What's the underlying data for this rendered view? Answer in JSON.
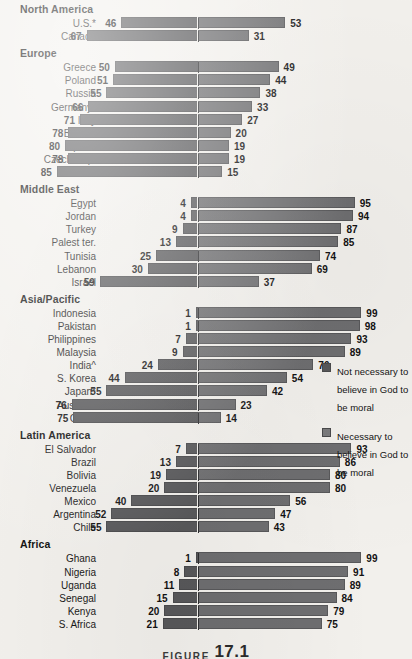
{
  "figure": {
    "word": "FIGURE",
    "number": "17.1"
  },
  "legend": {
    "items": [
      {
        "key": "not-necessary",
        "color": "#58585a",
        "label": "Not necessary to believe in God to be moral"
      },
      {
        "key": "necessary",
        "color": "#7b7b7d",
        "label": "Necessary to believe in God to be moral"
      }
    ]
  },
  "chart_data": {
    "type": "bar",
    "orientation": "horizontal",
    "subtype": "diverging-stacked",
    "title": "",
    "xlabel": "",
    "ylabel": "",
    "xlim": [
      -100,
      100
    ],
    "grid": false,
    "legend_position": "right",
    "series": [
      {
        "name": "Not necessary to believe in God to be moral",
        "side": "left",
        "color": "#58585a"
      },
      {
        "name": "Necessary to believe in God to be moral",
        "side": "right",
        "color": "#7b7b7d"
      }
    ],
    "groups": [
      {
        "name": "North America",
        "rows": [
          {
            "label": "U.S.*",
            "left": 46,
            "right": 53
          },
          {
            "label": "Canada",
            "left": 67,
            "right": 31
          }
        ]
      },
      {
        "name": "Europe",
        "rows": [
          {
            "label": "Greece",
            "left": 50,
            "right": 49
          },
          {
            "label": "Poland",
            "left": 51,
            "right": 44
          },
          {
            "label": "Russia",
            "left": 55,
            "right": 38
          },
          {
            "label": "Germany*",
            "left": 66,
            "right": 33
          },
          {
            "label": "Italy",
            "left": 71,
            "right": 27
          },
          {
            "label": "Britain*",
            "left": 78,
            "right": 20
          },
          {
            "label": "Spain*",
            "left": 80,
            "right": 19
          },
          {
            "label": "Czech Rep.",
            "left": 78,
            "right": 19
          },
          {
            "label": "France*",
            "left": 85,
            "right": 15
          }
        ]
      },
      {
        "name": "Middle East",
        "rows": [
          {
            "label": "Egypt",
            "left": 4,
            "right": 95
          },
          {
            "label": "Jordan",
            "left": 4,
            "right": 94
          },
          {
            "label": "Turkey",
            "left": 9,
            "right": 87
          },
          {
            "label": "Palest ter.",
            "left": 13,
            "right": 85
          },
          {
            "label": "Tunisia",
            "left": 25,
            "right": 74
          },
          {
            "label": "Lebanon",
            "left": 30,
            "right": 69
          },
          {
            "label": "Israel",
            "left": 59,
            "right": 37
          }
        ]
      },
      {
        "name": "Asia/Pacific",
        "rows": [
          {
            "label": "Indonesia",
            "left": 1,
            "right": 99
          },
          {
            "label": "Pakistan",
            "left": 1,
            "right": 98
          },
          {
            "label": "Philippines",
            "left": 7,
            "right": 93
          },
          {
            "label": "Malaysia",
            "left": 9,
            "right": 89
          },
          {
            "label": "India^",
            "left": 24,
            "right": 70
          },
          {
            "label": "S. Korea",
            "left": 44,
            "right": 54
          },
          {
            "label": "Japan*",
            "left": 55,
            "right": 42
          },
          {
            "label": "Australia",
            "left": 76,
            "right": 23
          },
          {
            "label": "China",
            "left": 75,
            "right": 14
          }
        ]
      },
      {
        "name": "Latin America",
        "rows": [
          {
            "label": "El Salvador",
            "left": 7,
            "right": 93
          },
          {
            "label": "Brazil",
            "left": 13,
            "right": 86
          },
          {
            "label": "Bolivia",
            "left": 19,
            "right": 80
          },
          {
            "label": "Venezuela",
            "left": 20,
            "right": 80
          },
          {
            "label": "Mexico",
            "left": 40,
            "right": 56
          },
          {
            "label": "Argentina",
            "left": 52,
            "right": 47
          },
          {
            "label": "Chile",
            "left": 55,
            "right": 43
          }
        ]
      },
      {
        "name": "Africa",
        "rows": [
          {
            "label": "Ghana",
            "left": 1,
            "right": 99
          },
          {
            "label": "Nigeria",
            "left": 8,
            "right": 91
          },
          {
            "label": "Uganda",
            "left": 11,
            "right": 89
          },
          {
            "label": "Senegal",
            "left": 15,
            "right": 84
          },
          {
            "label": "Kenya",
            "left": 20,
            "right": 79
          },
          {
            "label": "S. Africa",
            "left": 21,
            "right": 75
          }
        ]
      }
    ]
  }
}
